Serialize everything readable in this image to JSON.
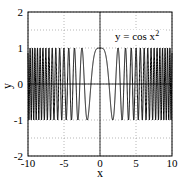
{
  "chart_data": {
    "type": "line",
    "title": "",
    "xlabel": "x",
    "ylabel": "y",
    "xlim": [
      -10,
      10
    ],
    "ylim": [
      -2,
      2
    ],
    "xticks": [
      "-10",
      "-5",
      "0",
      "5",
      "10"
    ],
    "yticks": [
      "2",
      "1",
      "0",
      "-1",
      "-2"
    ],
    "grid": true,
    "annotation": {
      "text": "y = cos x",
      "superscript": "2",
      "x": 5,
      "y": 1.3
    },
    "series": [
      {
        "name": "y = cos x^2",
        "function": "cos(x^2)",
        "x_range": [
          -10,
          10
        ],
        "color": "#000000"
      }
    ]
  }
}
